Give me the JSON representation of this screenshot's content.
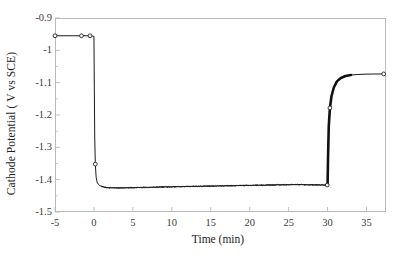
{
  "chart_data": {
    "type": "line",
    "title": "",
    "xlabel": "Time (min)",
    "ylabel": "Cathode Potential ( V vs SCE)",
    "xlim": [
      -5,
      37.5
    ],
    "ylim": [
      -1.5,
      -0.9
    ],
    "xticks": [
      -5,
      0,
      5,
      10,
      15,
      20,
      25,
      30,
      35
    ],
    "xtick_labels": [
      "-5",
      "0",
      "5",
      "10",
      "15",
      "20",
      "25",
      "30",
      "35"
    ],
    "yticks": [
      -0.9,
      -1.0,
      -1.1,
      -1.2,
      -1.3,
      -1.4,
      -1.5
    ],
    "ytick_labels": [
      "-0.9",
      "-1",
      "-1.1",
      "-1.2",
      "-1.3",
      "-1.4",
      "-1.5"
    ],
    "grid": false,
    "legend": null,
    "marker": "open-circle",
    "line_color": "#1a1a1a",
    "axis_color": "#b9b9b9",
    "series": [
      {
        "name": "Cathode potential",
        "x": [
          -5.0,
          -3.2,
          -1.6,
          -0.5,
          -0.15,
          0.0,
          0.05,
          0.1,
          0.18,
          0.28,
          0.4,
          0.55,
          0.75,
          1.0,
          1.3,
          1.7,
          2.2,
          2.8,
          3.5,
          4.3,
          5.2,
          6.2,
          7.3,
          8.5,
          9.8,
          11.0,
          12.3,
          13.6,
          15.0,
          16.4,
          17.8,
          19.2,
          20.6,
          22.0,
          23.4,
          24.8,
          26.2,
          27.6,
          29.0,
          29.7,
          29.95,
          30.0,
          30.05,
          30.15,
          30.3,
          30.5,
          30.8,
          31.2,
          31.7,
          32.3,
          33.0,
          33.8,
          34.8,
          36.0,
          37.2
        ],
        "y": [
          -0.955,
          -0.955,
          -0.955,
          -0.955,
          -0.956,
          -0.957,
          -1.12,
          -1.268,
          -1.352,
          -1.392,
          -1.407,
          -1.414,
          -1.418,
          -1.421,
          -1.423,
          -1.4245,
          -1.4252,
          -1.4255,
          -1.4253,
          -1.425,
          -1.4245,
          -1.424,
          -1.4235,
          -1.4228,
          -1.4222,
          -1.4216,
          -1.421,
          -1.4205,
          -1.4198,
          -1.4192,
          -1.4186,
          -1.418,
          -1.4174,
          -1.4168,
          -1.4162,
          -1.4157,
          -1.4151,
          -1.4158,
          -1.4162,
          -1.4165,
          -1.4166,
          -1.4166,
          -1.34,
          -1.235,
          -1.178,
          -1.142,
          -1.115,
          -1.096,
          -1.0855,
          -1.0795,
          -1.0765,
          -1.0748,
          -1.0738,
          -1.0732,
          -1.073
        ]
      }
    ],
    "annotations": {
      "initial_plateau_value": -0.955,
      "initial_plateau_range_min": -5,
      "initial_plateau_range_max": 0,
      "step_down_time": 0,
      "cathodic_plateau_value": -1.42,
      "step_up_time": 30,
      "final_plateau_value": -1.073,
      "marker_points_x": [
        -5.0,
        -1.6,
        -0.5,
        0.18,
        29.95,
        30.3,
        37.2
      ],
      "noise_amplitude": 0.0022
    }
  }
}
